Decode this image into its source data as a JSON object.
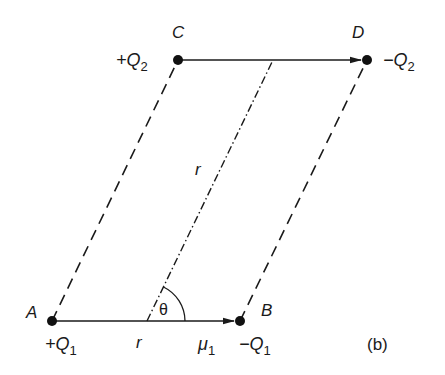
{
  "figure": {
    "tag": "(b)",
    "points": {
      "A": {
        "label": "A",
        "charge": "+Q",
        "charge_sub": "1"
      },
      "B": {
        "label": "B",
        "charge": "−Q",
        "charge_sub": "1"
      },
      "C": {
        "label": "C",
        "charge": "+Q",
        "charge_sub": "2"
      },
      "D": {
        "label": "D",
        "charge": "−Q",
        "charge_sub": "2"
      }
    },
    "dipole_moment": {
      "symbol": "μ",
      "sub": "1"
    },
    "angle": "θ",
    "distance": "r",
    "origin_label": "r"
  }
}
